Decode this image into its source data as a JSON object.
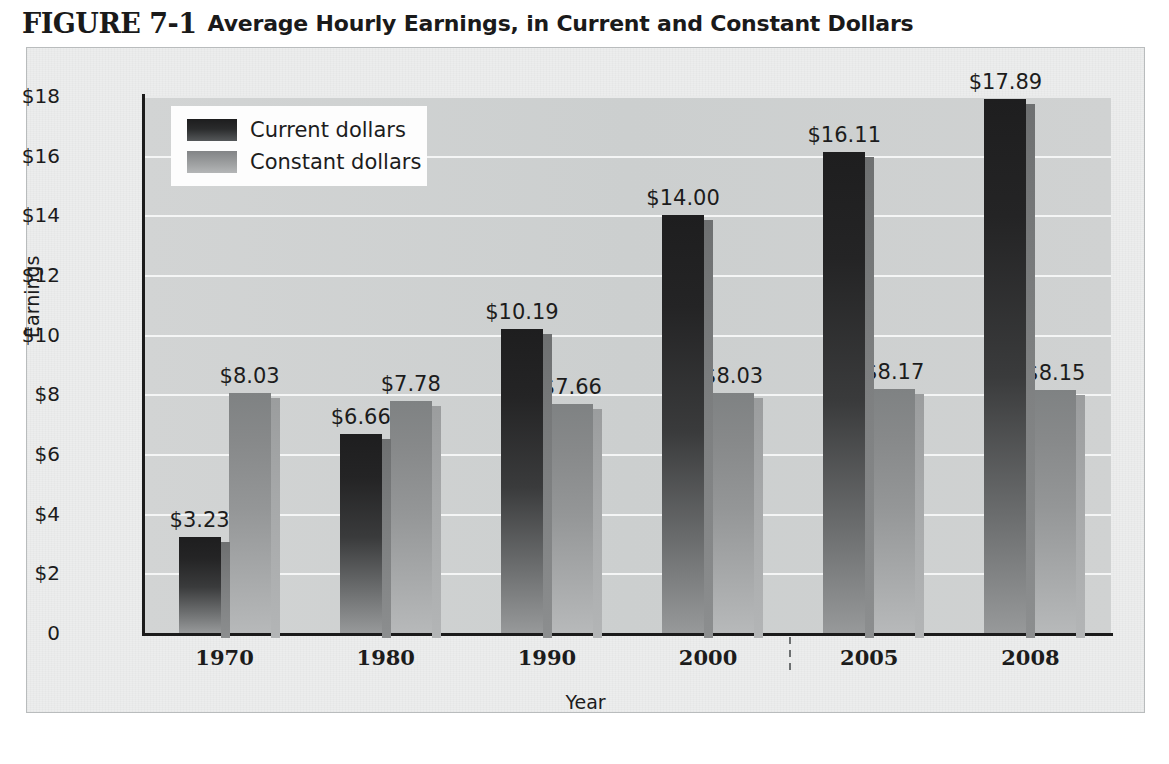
{
  "figure": {
    "number": "FIGURE 7-1",
    "caption": "Average Hourly Earnings, in Current and Constant Dollars"
  },
  "chart_data": {
    "type": "bar",
    "title": "Average Hourly Earnings, in Current and Constant Dollars",
    "xlabel": "Year",
    "ylabel": "Earnings",
    "categories": [
      "1970",
      "1980",
      "1990",
      "2000",
      "2005",
      "2008"
    ],
    "series": [
      {
        "name": "Current dollars",
        "color": "#242425",
        "values": [
          3.23,
          6.66,
          10.19,
          14.0,
          16.11,
          17.89
        ],
        "labels": [
          "$3.23",
          "$6.66",
          "$10.19",
          "$14.00",
          "$16.11",
          "$17.89"
        ]
      },
      {
        "name": "Constant dollars",
        "color": "#9a9c9d",
        "values": [
          8.03,
          7.78,
          7.66,
          8.03,
          8.17,
          8.15
        ],
        "labels": [
          "$8.03",
          "$7.78",
          "$7.66",
          "$8.03",
          "$8.17",
          "$8.15"
        ]
      }
    ],
    "ylim": [
      0,
      18
    ],
    "yticks": [
      0,
      2,
      4,
      6,
      8,
      10,
      12,
      14,
      16,
      18
    ],
    "ytick_labels": [
      "0",
      "$2",
      "$4",
      "$6",
      "$8",
      "$10",
      "$12",
      "$14",
      "$16",
      "$18"
    ],
    "grid": true,
    "legend_position": "upper-left",
    "axis_break_after_category": "2000"
  },
  "legend": {
    "entries": [
      {
        "label": "Current dollars"
      },
      {
        "label": "Constant dollars"
      }
    ]
  }
}
